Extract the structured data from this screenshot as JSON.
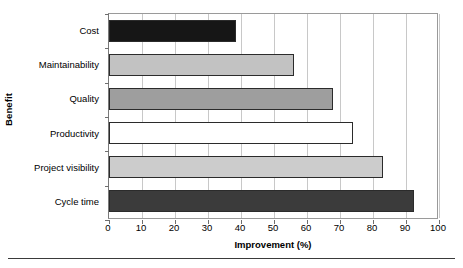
{
  "chart_data": {
    "type": "bar",
    "orientation": "horizontal",
    "title": "",
    "xlabel": "Improvement (%)",
    "ylabel": "Benefit",
    "xlim": [
      0,
      100
    ],
    "xticks": [
      0,
      10,
      20,
      30,
      40,
      50,
      60,
      70,
      80,
      90,
      100
    ],
    "xtick_labels": [
      "0",
      "10",
      "20",
      "30",
      "40",
      "50",
      "60",
      "70",
      "80",
      "90",
      "100"
    ],
    "grid": "vertical",
    "legend": "none",
    "categories": [
      "Cost",
      "Maintainability",
      "Quality",
      "Productivity",
      "Project visibility",
      "Cycle time"
    ],
    "values": [
      38.5,
      56,
      68,
      74,
      83,
      92.5
    ],
    "bar_colors": [
      "#161616",
      "#c2c2c2",
      "#9e9e9e",
      "#ffffff",
      "#cccccc",
      "#3b3b3b"
    ],
    "bar_edge_color": "#2b2b2b",
    "gridline_color": "#c8c8c8",
    "axis_color": "#7a7a7a",
    "background_color": "#ffffff",
    "bars": [
      {
        "category": "Cost",
        "value": 38.5,
        "color": "#161616"
      },
      {
        "category": "Maintainability",
        "value": 56,
        "color": "#c2c2c2"
      },
      {
        "category": "Quality",
        "value": 68,
        "color": "#9e9e9e"
      },
      {
        "category": "Productivity",
        "value": 74,
        "color": "#ffffff"
      },
      {
        "category": "Project visibility",
        "value": 83,
        "color": "#cccccc"
      },
      {
        "category": "Cycle time",
        "value": 92.5,
        "color": "#3b3b3b"
      }
    ]
  }
}
